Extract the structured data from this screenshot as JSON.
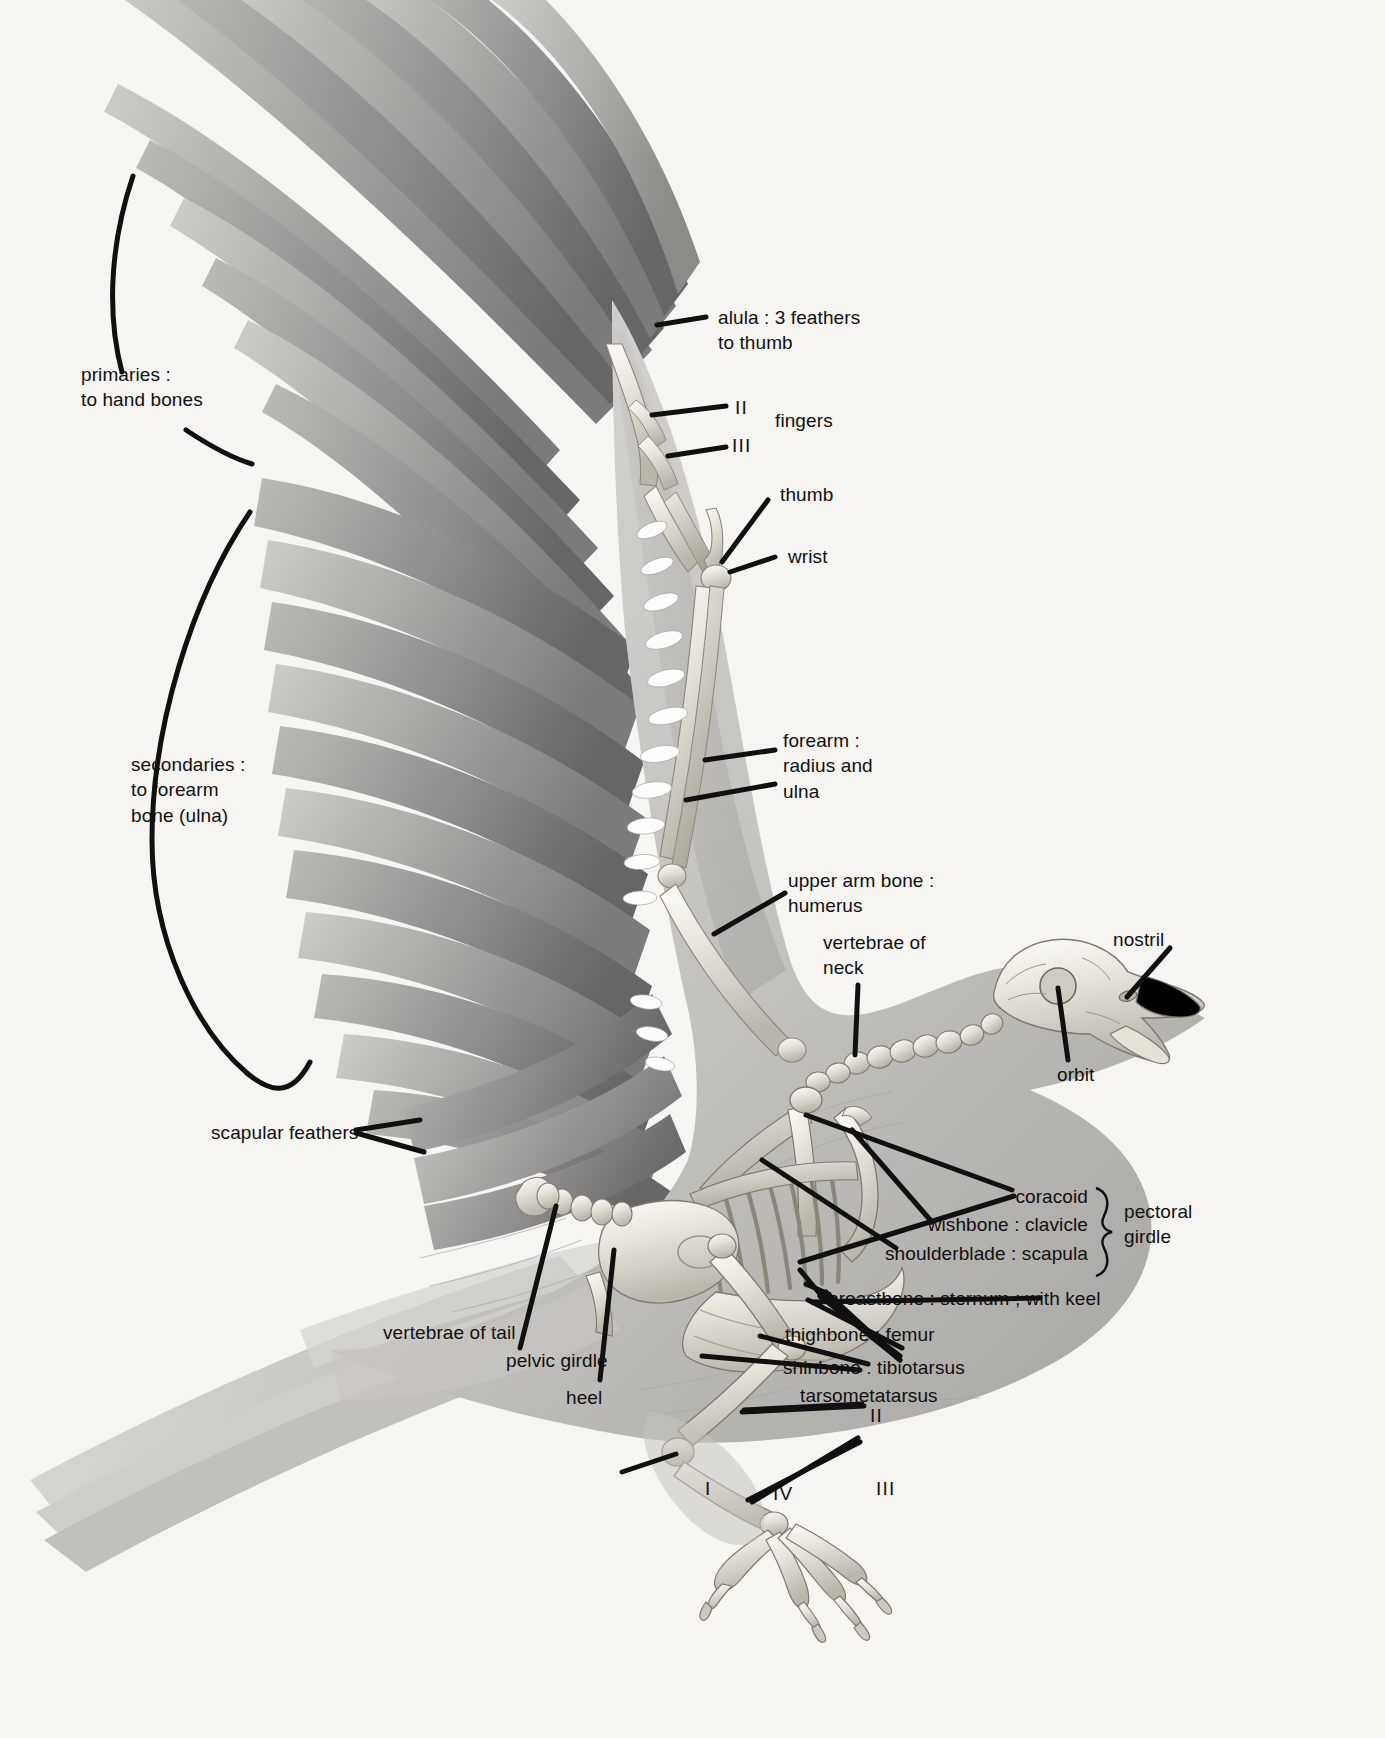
{
  "page": {
    "background_color": "#f6f5f2",
    "ink_color": "#101010",
    "width": 1385,
    "height": 1738
  },
  "labels": {
    "primaries": "primaries :\nto hand bones",
    "secondaries": "secondaries :\nto forearm\nbone (ulna)",
    "alula": "alula : 3 feathers\nto thumb",
    "finger_two": "II",
    "finger_three": "III",
    "fingers": "fingers",
    "thumb": "thumb",
    "wrist": "wrist",
    "forearm": "forearm :\nradius and\nulna",
    "humerus": "upper arm bone :\nhumerus",
    "neck_vertebrae": "vertebrae of\nneck",
    "nostril": "nostril",
    "orbit": "orbit",
    "scapular_feathers": "scapular feathers",
    "coracoid": "coracoid",
    "clavicle": "wishbone : clavicle",
    "scapula": "shoulderblade : scapula",
    "pectoral_girdle": "pectoral\ngirdle",
    "sternum": "breastbone : sternum ; with keel",
    "femur": "thighbone : femur",
    "tibiotarsus": "shinbone : tibiotarsus",
    "tarsometatarsus": "tarsometatarsus",
    "tail_vertebrae": "vertebrae of tail",
    "pelvic_girdle": "pelvic girdle",
    "heel": "heel",
    "toe_one": "I",
    "toe_two": "II",
    "toe_three": "III",
    "toe_four": "IV"
  },
  "figure": {
    "feather_groups": [
      "primaries",
      "secondaries",
      "scapular feathers",
      "alula",
      "tail feathers"
    ],
    "skeleton_parts": [
      "skull",
      "nostril",
      "orbit",
      "cervical vertebrae",
      "coracoid",
      "clavicle",
      "scapula",
      "humerus",
      "radius",
      "ulna",
      "carpometacarpus",
      "digits",
      "sternum with keel",
      "ribs",
      "pelvis",
      "caudal vertebrae",
      "femur",
      "tibiotarsus",
      "tarsometatarsus",
      "toes"
    ]
  }
}
